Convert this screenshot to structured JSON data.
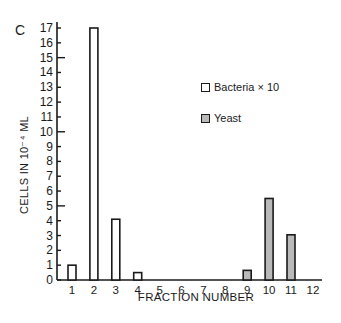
{
  "panel_label": "C",
  "chart_data": {
    "type": "bar",
    "title": "",
    "xlabel": "FRACTION NUMBER",
    "ylabel": "CELLS IN 10^-4 ML",
    "ylabel_display": "CELLS IN 10⁻⁴ ML",
    "categories": [
      "1",
      "2",
      "3",
      "4",
      "5",
      "6",
      "7",
      "8",
      "9",
      "10",
      "11",
      "12"
    ],
    "series": [
      {
        "name": "Bacteria × 10",
        "fill": "#ffffff",
        "values": [
          1.0,
          17.0,
          4.1,
          0.5,
          0,
          0,
          0,
          0,
          0,
          0,
          0,
          0
        ]
      },
      {
        "name": "Yeast",
        "fill": "#b9b9b9",
        "values": [
          0,
          0,
          0,
          0,
          0,
          0,
          0,
          0,
          0.65,
          5.5,
          3.05,
          0
        ]
      }
    ],
    "yticks": [
      0,
      1,
      2,
      3,
      4,
      5,
      6,
      7,
      8,
      9,
      10,
      11,
      12,
      13,
      14,
      15,
      16,
      17
    ],
    "ylim": [
      0,
      17
    ],
    "grid": false,
    "legend_position": "upper right (inside)"
  },
  "legend": {
    "bacteria_label": "Bacteria × 10",
    "yeast_label": "Yeast"
  }
}
